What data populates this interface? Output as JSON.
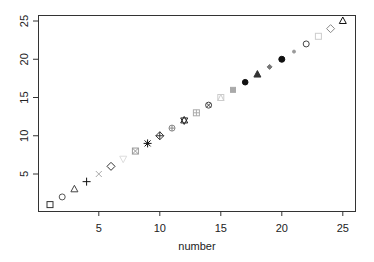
{
  "chart_data": {
    "type": "scatter",
    "title": "",
    "xlabel": "number",
    "ylabel": "",
    "xlim": [
      0.5,
      26
    ],
    "ylim": [
      0,
      26
    ],
    "grid": false,
    "legend": null,
    "x_ticks": [
      5,
      10,
      15,
      20,
      25
    ],
    "y_ticks": [
      5,
      10,
      15,
      20,
      25
    ],
    "x_tick_labels": [
      "5",
      "10",
      "15",
      "20",
      "25"
    ],
    "y_tick_labels": [
      "5",
      "10",
      "15",
      "20",
      "25"
    ],
    "points": [
      {
        "x": 1,
        "y": 1,
        "pch": 0,
        "shape": "open-square",
        "color": "#333333"
      },
      {
        "x": 2,
        "y": 2,
        "pch": 1,
        "shape": "open-circle",
        "color": "#555555"
      },
      {
        "x": 3,
        "y": 3,
        "pch": 2,
        "shape": "open-triangle",
        "color": "#444444"
      },
      {
        "x": 4,
        "y": 4,
        "pch": 3,
        "shape": "plus",
        "color": "#111111"
      },
      {
        "x": 5,
        "y": 5,
        "pch": 4,
        "shape": "cross",
        "color": "#aaaaaa"
      },
      {
        "x": 6,
        "y": 6,
        "pch": 5,
        "shape": "open-diamond",
        "color": "#333333"
      },
      {
        "x": 7,
        "y": 7,
        "pch": 6,
        "shape": "open-down-triangle",
        "color": "#dddddd"
      },
      {
        "x": 8,
        "y": 8,
        "pch": 7,
        "shape": "square-cross",
        "color": "#999999"
      },
      {
        "x": 9,
        "y": 9,
        "pch": 8,
        "shape": "asterisk",
        "color": "#111111"
      },
      {
        "x": 10,
        "y": 10,
        "pch": 9,
        "shape": "diamond-plus",
        "color": "#333333"
      },
      {
        "x": 11,
        "y": 11,
        "pch": 10,
        "shape": "circle-plus",
        "color": "#888888"
      },
      {
        "x": 12,
        "y": 12,
        "pch": 11,
        "shape": "star-of-david",
        "color": "#222222"
      },
      {
        "x": 13,
        "y": 13,
        "pch": 12,
        "shape": "square-plus",
        "color": "#aaaaaa"
      },
      {
        "x": 14,
        "y": 14,
        "pch": 13,
        "shape": "circle-cross",
        "color": "#444444"
      },
      {
        "x": 15,
        "y": 15,
        "pch": 14,
        "shape": "square-triangle",
        "color": "#cccccc"
      },
      {
        "x": 16,
        "y": 16,
        "pch": 15,
        "shape": "filled-square",
        "color": "#aaaaaa"
      },
      {
        "x": 17,
        "y": 17,
        "pch": 16,
        "shape": "filled-circle",
        "color": "#111111"
      },
      {
        "x": 18,
        "y": 18,
        "pch": 17,
        "shape": "filled-triangle",
        "color": "#333333"
      },
      {
        "x": 19,
        "y": 19,
        "pch": 18,
        "shape": "filled-diamond",
        "color": "#777777"
      },
      {
        "x": 20,
        "y": 20,
        "pch": 19,
        "shape": "filled-circle-large",
        "color": "#111111"
      },
      {
        "x": 21,
        "y": 21,
        "pch": 20,
        "shape": "small-dot",
        "color": "#999999"
      },
      {
        "x": 22,
        "y": 22,
        "pch": 21,
        "shape": "open-circle",
        "color": "#444444"
      },
      {
        "x": 23,
        "y": 23,
        "pch": 22,
        "shape": "open-square",
        "color": "#cccccc"
      },
      {
        "x": 24,
        "y": 24,
        "pch": 23,
        "shape": "open-diamond",
        "color": "#888888"
      },
      {
        "x": 25,
        "y": 25,
        "pch": 24,
        "shape": "open-triangle",
        "color": "#111111"
      }
    ]
  }
}
